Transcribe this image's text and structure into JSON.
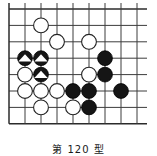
{
  "figure": {
    "kind": "go-board-diagram",
    "caption": "第 120 型",
    "caption_note": "caption clipped at image bottom edge"
  },
  "board": {
    "columns": 9,
    "rows": 8,
    "origin_x": 9,
    "origin_y": 9,
    "step_x": 16,
    "step_y": 16.4,
    "line_color": "#3c3c3c",
    "border_color": "#2b2b2b",
    "background": "#ffffff",
    "stone_radius": 7.4,
    "star_points": [
      [
        3,
        5
      ]
    ],
    "edges": {
      "left": true,
      "top": true,
      "right": false,
      "bottom": true
    }
  },
  "colors": {
    "black_stone_fill": "#151515",
    "black_stone_edge": "#000000",
    "white_stone_fill": "#ffffff",
    "white_stone_edge": "#242424",
    "marker_triangle": "#ffffff"
  },
  "stones": [
    {
      "id": "w1",
      "color": "white",
      "col": 2,
      "row": 1,
      "marker": "none"
    },
    {
      "id": "w2",
      "color": "white",
      "col": 3,
      "row": 2,
      "marker": "none"
    },
    {
      "id": "w3",
      "color": "white",
      "col": 5,
      "row": 2,
      "marker": "none"
    },
    {
      "id": "b1",
      "color": "black",
      "col": 1,
      "row": 3,
      "marker": "triangle"
    },
    {
      "id": "b2",
      "color": "black",
      "col": 2,
      "row": 3,
      "marker": "triangle"
    },
    {
      "id": "b3",
      "color": "black",
      "col": 6,
      "row": 3,
      "marker": "none"
    },
    {
      "id": "w4",
      "color": "white",
      "col": 1,
      "row": 4,
      "marker": "none"
    },
    {
      "id": "b4",
      "color": "black",
      "col": 2,
      "row": 4,
      "marker": "triangle"
    },
    {
      "id": "w5",
      "color": "white",
      "col": 5,
      "row": 4,
      "marker": "none"
    },
    {
      "id": "b5",
      "color": "black",
      "col": 6,
      "row": 4,
      "marker": "none"
    },
    {
      "id": "w6",
      "color": "white",
      "col": 1,
      "row": 5,
      "marker": "none"
    },
    {
      "id": "w7",
      "color": "white",
      "col": 2,
      "row": 5,
      "marker": "none"
    },
    {
      "id": "w8",
      "color": "white",
      "col": 3,
      "row": 5,
      "marker": "none"
    },
    {
      "id": "b6",
      "color": "black",
      "col": 4,
      "row": 5,
      "marker": "none"
    },
    {
      "id": "b7",
      "color": "black",
      "col": 5,
      "row": 5,
      "marker": "none"
    },
    {
      "id": "b8",
      "color": "black",
      "col": 7,
      "row": 5,
      "marker": "none"
    },
    {
      "id": "w9",
      "color": "white",
      "col": 2,
      "row": 6,
      "marker": "none"
    },
    {
      "id": "w10",
      "color": "white",
      "col": 4,
      "row": 6,
      "marker": "none"
    },
    {
      "id": "b9",
      "color": "black",
      "col": 5,
      "row": 6,
      "marker": "none"
    }
  ]
}
